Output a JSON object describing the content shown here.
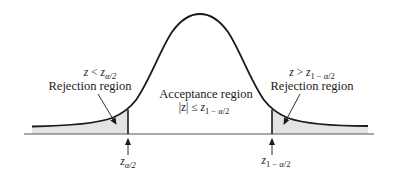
{
  "diagram": {
    "type": "two-tailed hypothesis test on a normal curve",
    "colors": {
      "curve": "#1a1a1a",
      "baseline": "#555555",
      "rejection_fill": "#e3e3e3",
      "text": "#1a1a1a"
    },
    "left_region": {
      "condition_var": "z",
      "condition_op": " < ",
      "condition_z": "z",
      "condition_sub": "α/2",
      "label": "Rejection region"
    },
    "center_region": {
      "label": "Acceptance region",
      "condition_prefix": "|z| ≤ ",
      "condition_z": "z",
      "condition_sub": "1 − α/2"
    },
    "right_region": {
      "condition_var": "z",
      "condition_op": " > ",
      "condition_z": "z",
      "condition_sub": "1 − α/2",
      "label": "Rejection region"
    },
    "left_critical": {
      "z": "z",
      "sub": "α/2"
    },
    "right_critical": {
      "z": "z",
      "sub": "1 − α/2"
    }
  }
}
